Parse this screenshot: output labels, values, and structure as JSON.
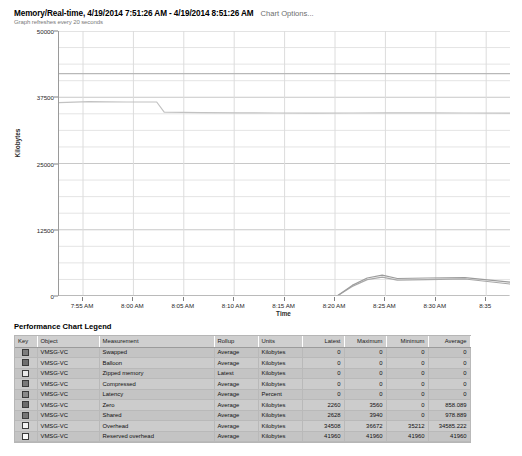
{
  "header": {
    "title": "Memory/Real-time, 4/19/2014 7:51:26 AM - 4/19/2014 8:51:26 AM",
    "chart_options_label": "Chart Options...",
    "refresh_note": "Graph refreshes every 20 seconds"
  },
  "legend": {
    "title": "Performance Chart Legend",
    "columns": [
      "Key",
      "Object",
      "Measurement",
      "Rollup",
      "Units",
      "Latest",
      "Maximum",
      "Minimum",
      "Average"
    ],
    "rows": [
      {
        "key_color": "#7d7d7d",
        "object": "VMSG-VC",
        "measurement": "Swapped",
        "rollup": "Average",
        "units": "Kilobytes",
        "latest": "0",
        "maximum": "0",
        "minimum": "0",
        "average": "0"
      },
      {
        "key_color": "#6f6f6f",
        "object": "VMSG-VC",
        "measurement": "Balloon",
        "rollup": "Average",
        "units": "Kilobytes",
        "latest": "0",
        "maximum": "0",
        "minimum": "0",
        "average": "0"
      },
      {
        "key_color": "#e8e8e8",
        "object": "VMSG-VC",
        "measurement": "Zipped memory",
        "rollup": "Latest",
        "units": "Kilobytes",
        "latest": "0",
        "maximum": "0",
        "minimum": "0",
        "average": "0"
      },
      {
        "key_color": "#7a7a7a",
        "object": "VMSG-VC",
        "measurement": "Compressed",
        "rollup": "Average",
        "units": "Kilobytes",
        "latest": "0",
        "maximum": "0",
        "minimum": "0",
        "average": "0"
      },
      {
        "key_color": "#8a8a8a",
        "object": "VMSG-VC",
        "measurement": "Latency",
        "rollup": "Average",
        "units": "Percent",
        "latest": "0",
        "maximum": "0",
        "minimum": "0",
        "average": "0"
      },
      {
        "key_color": "#6b6b6b",
        "object": "VMSG-VC",
        "measurement": "Zero",
        "rollup": "Average",
        "units": "Kilobytes",
        "latest": "2260",
        "maximum": "3560",
        "minimum": "0",
        "average": "858.089"
      },
      {
        "key_color": "#757575",
        "object": "VMSG-VC",
        "measurement": "Shared",
        "rollup": "Average",
        "units": "Kilobytes",
        "latest": "2628",
        "maximum": "3940",
        "minimum": "0",
        "average": "978.889"
      },
      {
        "key_color": "#f2f2f2",
        "object": "VMSG-VC",
        "measurement": "Overhead",
        "rollup": "Average",
        "units": "Kilobytes",
        "latest": "34508",
        "maximum": "36672",
        "minimum": "35212",
        "average": "34585.222"
      },
      {
        "key_color": "#fbfbfb",
        "object": "VMSG-VC",
        "measurement": "Reserved overhead",
        "rollup": "Average",
        "units": "Kilobytes",
        "latest": "41960",
        "maximum": "41960",
        "minimum": "41960",
        "average": "41960"
      }
    ]
  },
  "chart_data": {
    "type": "line",
    "title": "Memory/Real-time, 4/19/2014 7:51:26 AM - 4/19/2014 8:51:26 AM",
    "xlabel": "Time",
    "ylabel": "Kilobytes",
    "ylim": [
      0,
      50000
    ],
    "yticks": [
      0,
      12500,
      25000,
      37500,
      50000
    ],
    "ytick_labels": [
      "0",
      "12500",
      "25000",
      "37500",
      "50000"
    ],
    "xticks": [
      "7:55 AM",
      "8:00 AM",
      "8:05 AM",
      "8:10 AM",
      "8:15 AM",
      "8:20 AM",
      "8:25 AM",
      "8:30 AM",
      "8:35"
    ],
    "grid": true,
    "legend_position": "below-table",
    "series": [
      {
        "name": "Reserved overhead",
        "color": "#b8b8b8",
        "x": [
          "7:51",
          "7:55",
          "8:00",
          "8:04",
          "8:05",
          "8:10",
          "8:15",
          "8:20",
          "8:25",
          "8:30",
          "8:35",
          "8:40",
          "8:45",
          "8:51"
        ],
        "values": [
          41960,
          41960,
          41960,
          41960,
          41960,
          41960,
          41960,
          41960,
          41960,
          41960,
          41960,
          41960,
          41960,
          41960
        ]
      },
      {
        "name": "Overhead",
        "color": "#c2c2c2",
        "x": [
          "7:51",
          "7:55",
          "8:00",
          "8:04",
          "8:05",
          "8:10",
          "8:15",
          "8:20",
          "8:25",
          "8:30",
          "8:35",
          "8:40",
          "8:45",
          "8:51"
        ],
        "values": [
          36500,
          36672,
          36600,
          36600,
          34700,
          34600,
          34550,
          34520,
          34500,
          34520,
          34560,
          34540,
          34520,
          34508
        ]
      },
      {
        "name": "Zero",
        "color": "#a8a8a8",
        "x": [
          "7:51",
          "8:00",
          "8:10",
          "8:20",
          "8:28",
          "8:30",
          "8:32",
          "8:34",
          "8:36",
          "8:40",
          "8:45",
          "8:51"
        ],
        "values": [
          0,
          0,
          0,
          0,
          0,
          1800,
          3100,
          3560,
          3000,
          3100,
          3200,
          2260
        ]
      },
      {
        "name": "Shared",
        "color": "#9c9c9c",
        "x": [
          "7:51",
          "8:00",
          "8:10",
          "8:20",
          "8:28",
          "8:30",
          "8:32",
          "8:34",
          "8:36",
          "8:40",
          "8:45",
          "8:51"
        ],
        "values": [
          0,
          0,
          0,
          0,
          0,
          2000,
          3400,
          3940,
          3300,
          3400,
          3450,
          2628
        ]
      },
      {
        "name": "Swapped / Balloon / Zipped / Compressed / Latency",
        "color": "#cfcfcf",
        "x": [
          "7:51",
          "8:51"
        ],
        "values": [
          0,
          0
        ]
      }
    ]
  }
}
